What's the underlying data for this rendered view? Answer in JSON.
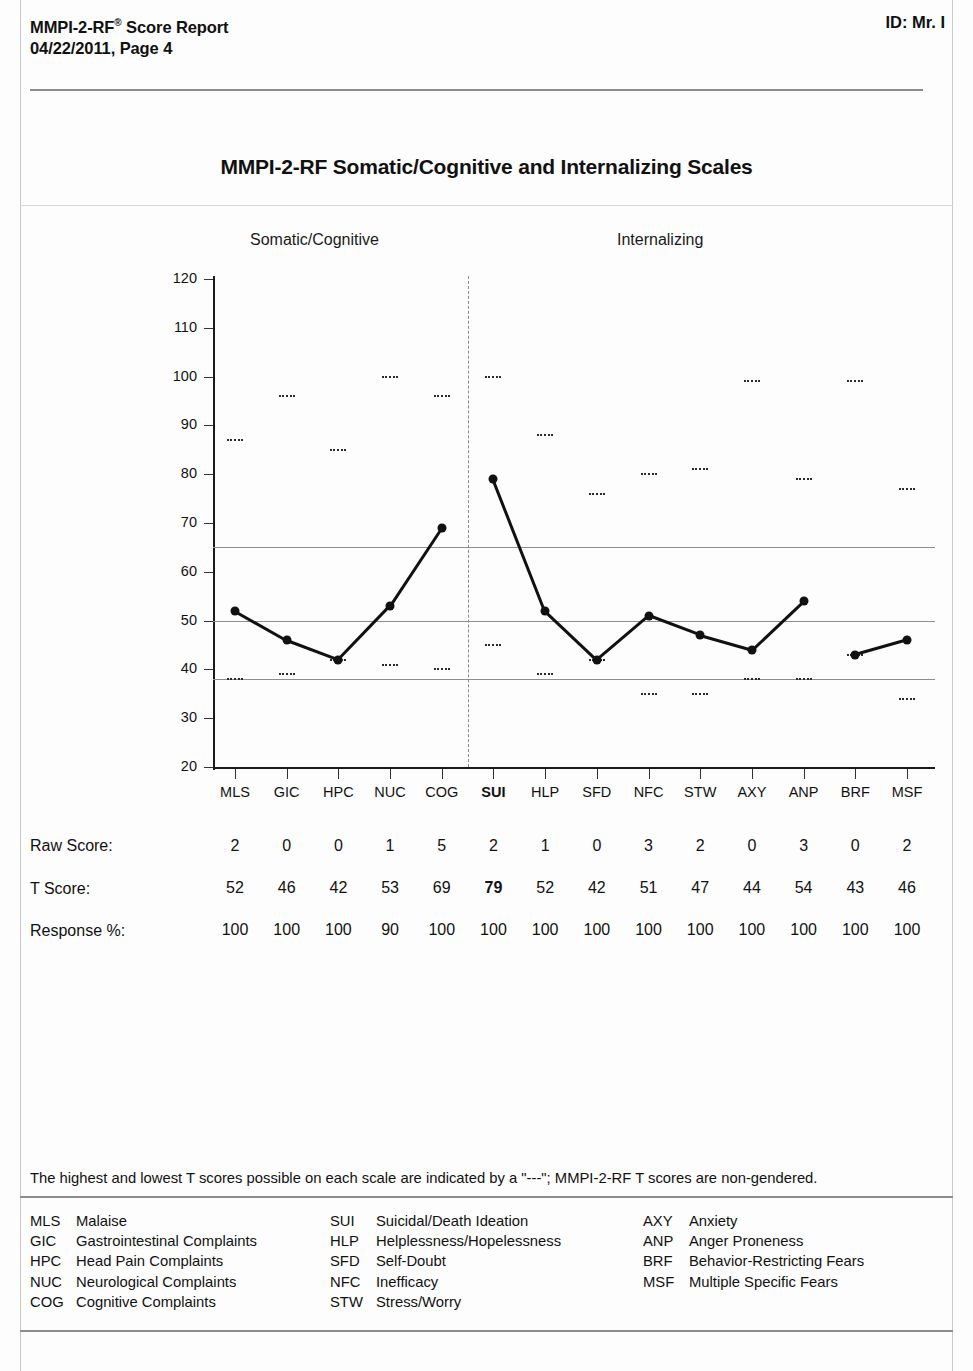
{
  "header": {
    "title_line1": "MMPI-2-RF",
    "title_sup": "®",
    "title_line1_rest": " Score Report",
    "title_line2": "04/22/2011, Page 4",
    "id_label": "ID: Mr. I"
  },
  "chart_title": "MMPI-2-RF Somatic/Cognitive and Internalizing Scales",
  "sections": {
    "somatic": "Somatic/Cognitive",
    "internalizing": "Internalizing"
  },
  "rows": {
    "raw_label": "Raw Score:",
    "t_label": "T Score:",
    "response_label": "Response %:"
  },
  "footnote": "The highest and lowest T scores possible on each scale are indicated by a \"---\"; MMPI-2-RF T scores are non-gendered.",
  "legend": [
    [
      {
        "abbr": "MLS",
        "name": "Malaise"
      },
      {
        "abbr": "GIC",
        "name": "Gastrointestinal Complaints"
      },
      {
        "abbr": "HPC",
        "name": "Head Pain Complaints"
      },
      {
        "abbr": "NUC",
        "name": "Neurological Complaints"
      },
      {
        "abbr": "COG",
        "name": "Cognitive Complaints"
      }
    ],
    [
      {
        "abbr": "SUI",
        "name": "Suicidal/Death Ideation"
      },
      {
        "abbr": "HLP",
        "name": "Helplessness/Hopelessness"
      },
      {
        "abbr": "SFD",
        "name": "Self-Doubt"
      },
      {
        "abbr": "NFC",
        "name": "Inefficacy"
      },
      {
        "abbr": "STW",
        "name": "Stress/Worry"
      }
    ],
    [
      {
        "abbr": "AXY",
        "name": "Anxiety"
      },
      {
        "abbr": "ANP",
        "name": "Anger Proneness"
      },
      {
        "abbr": "BRF",
        "name": "Behavior-Restricting Fears"
      },
      {
        "abbr": "MSF",
        "name": "Multiple Specific Fears"
      }
    ]
  ],
  "chart_data": {
    "type": "line",
    "title": "MMPI-2-RF Somatic/Cognitive and Internalizing Scales",
    "xlabel": "",
    "ylabel": "",
    "ylim": [
      20,
      120
    ],
    "yticks": [
      20,
      30,
      40,
      50,
      60,
      70,
      80,
      90,
      100,
      110,
      120
    ],
    "grid": false,
    "reference_lines": [
      65,
      50,
      38
    ],
    "group_divider_after": "COG",
    "line_breaks_after": [
      "COG",
      "ANP"
    ],
    "categories": [
      "MLS",
      "GIC",
      "HPC",
      "NUC",
      "COG",
      "SUI",
      "HLP",
      "SFD",
      "NFC",
      "STW",
      "AXY",
      "ANP",
      "BRF",
      "MSF"
    ],
    "highlighted_category": "SUI",
    "groups": [
      {
        "name": "Somatic/Cognitive",
        "categories": [
          "MLS",
          "GIC",
          "HPC",
          "NUC",
          "COG"
        ]
      },
      {
        "name": "Internalizing",
        "categories": [
          "SUI",
          "HLP",
          "SFD",
          "NFC",
          "STW",
          "AXY",
          "ANP",
          "BRF",
          "MSF"
        ]
      }
    ],
    "series": [
      {
        "name": "T Score",
        "values": [
          52,
          46,
          42,
          53,
          69,
          79,
          52,
          42,
          51,
          47,
          44,
          54,
          43,
          46
        ]
      },
      {
        "name": "Raw Score",
        "values": [
          2,
          0,
          0,
          1,
          5,
          2,
          1,
          0,
          3,
          2,
          0,
          3,
          0,
          2
        ]
      },
      {
        "name": "Response %",
        "values": [
          100,
          100,
          100,
          90,
          100,
          100,
          100,
          100,
          100,
          100,
          100,
          100,
          100,
          100
        ]
      }
    ],
    "max_markers": [
      87,
      96,
      85,
      100,
      96,
      100,
      88,
      76,
      80,
      81,
      99,
      79,
      99,
      77
    ],
    "min_markers": [
      38,
      39,
      42,
      41,
      40,
      45,
      39,
      42,
      35,
      35,
      38,
      38,
      43,
      34
    ]
  }
}
